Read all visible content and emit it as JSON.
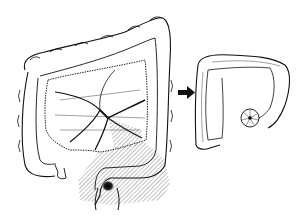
{
  "figure": {
    "panels": [
      {
        "id": "before",
        "subject": "full-colon-with-mesentery-and-tumor"
      },
      {
        "id": "after",
        "subject": "shortened-colon-with-stoma"
      }
    ],
    "arrow": {
      "direction": "right"
    },
    "colors": {
      "line": "#111111",
      "background": "#ffffff",
      "hatch": "#555555",
      "tumor": "#000000"
    }
  }
}
